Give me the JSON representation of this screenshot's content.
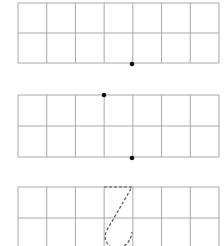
{
  "diagram": {
    "grid_color": "#a8a8a8",
    "dot_color": "#111111",
    "dash_color": "#555555",
    "columns": 7,
    "rows": 2,
    "cell_width": 28.7,
    "panels": [
      {
        "name": "panel-1",
        "x": 18,
        "y": 3,
        "width": 201,
        "height": 60,
        "dots": [
          {
            "x": 132,
            "y": 64
          }
        ]
      },
      {
        "name": "panel-2",
        "x": 18,
        "y": 95,
        "width": 201,
        "height": 62,
        "dots": [
          {
            "x": 104,
            "y": 95
          },
          {
            "x": 132,
            "y": 158
          }
        ]
      },
      {
        "name": "panel-3",
        "x": 18,
        "y": 187,
        "width": 201,
        "height": 62,
        "dashed_path": "M104,187 L132,187 L107,230 Q102,240 110,246 M124,246 Q131,241 132,232"
      }
    ]
  }
}
